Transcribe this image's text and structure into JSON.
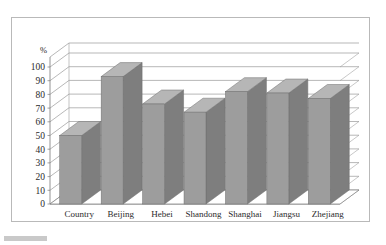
{
  "chart_data": {
    "type": "bar",
    "title": "",
    "subtitle": "",
    "xlabel": "",
    "ylabel": "%",
    "unit_label": "%",
    "categories": [
      "Country",
      "Beijing",
      "Hebei",
      "Shandong",
      "Shanghai",
      "Jiangsu",
      "Zhejiang"
    ],
    "values": [
      50,
      93,
      73,
      67,
      82,
      81,
      77
    ],
    "series": [
      {
        "name": "",
        "values": [
          50,
          93,
          73,
          67,
          82,
          81,
          77
        ]
      }
    ],
    "ylim": [
      0,
      100
    ],
    "ytick_step": 10,
    "ytick_labels": [
      "0",
      "10",
      "20",
      "30",
      "40",
      "50",
      "60",
      "70",
      "80",
      "90",
      "100"
    ],
    "grid": true,
    "grid_axis": "y",
    "legend": false,
    "legend_position": "none",
    "style": "3d-column",
    "annotations": []
  },
  "colors": {
    "bar_front": "#9d9d9d",
    "bar_side": "#7e7e7e",
    "bar_top": "#b6b6b6",
    "bar_outline": "#6f6f6f",
    "grid": "#9a9a9a",
    "axis": "#7a7a7a",
    "frame_border": "#b9b9b9",
    "plot_background": "#ffffff",
    "page_background": "#ffffff",
    "text": "#2b2b2b",
    "artifact": "#c9c9c9"
  },
  "frame": {
    "border_label": "chart-border"
  }
}
